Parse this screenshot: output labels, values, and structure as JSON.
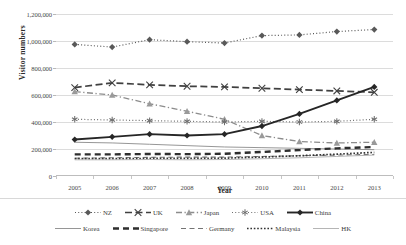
{
  "chart_data": {
    "type": "line",
    "title": "",
    "xlabel": "Year",
    "ylabel": "Visitor numbers",
    "categories": [
      "2005",
      "2006",
      "2007",
      "2008",
      "2009",
      "2010",
      "2011",
      "2012",
      "2013"
    ],
    "x": [
      2005,
      2006,
      2007,
      2008,
      2009,
      2010,
      2011,
      2012,
      2013
    ],
    "ylim": [
      0,
      1200000
    ],
    "ytick_labels": [
      "0",
      "200,000",
      "400,000",
      "600,000",
      "800,000",
      "1,000,000",
      "1,200,000"
    ],
    "ytick_values": [
      0,
      200000,
      400000,
      600000,
      800000,
      1000000,
      1200000
    ],
    "grid": true,
    "legend_position": "bottom",
    "series": [
      {
        "name": "NZ",
        "style": "dotted",
        "marker": "diamond",
        "color": "#595959",
        "values": [
          975000,
          955000,
          1010000,
          995000,
          985000,
          1040000,
          1045000,
          1070000,
          1085000
        ]
      },
      {
        "name": "UK",
        "style": "dashed",
        "marker": "x",
        "color": "#404040",
        "values": [
          655000,
          690000,
          675000,
          665000,
          660000,
          650000,
          640000,
          630000,
          620000
        ]
      },
      {
        "name": "Japan",
        "style": "dashdot",
        "marker": "triangle",
        "color": "#8c8c8c",
        "values": [
          625000,
          600000,
          535000,
          480000,
          420000,
          300000,
          255000,
          245000,
          250000
        ]
      },
      {
        "name": "USA",
        "style": "dotted",
        "marker": "asterisk",
        "color": "#6e6e6e",
        "values": [
          420000,
          415000,
          410000,
          405000,
          400000,
          405000,
          400000,
          405000,
          420000
        ]
      },
      {
        "name": "China",
        "style": "solid",
        "marker": "diamond",
        "color": "#262626",
        "values": [
          270000,
          290000,
          310000,
          300000,
          310000,
          370000,
          460000,
          560000,
          660000
        ]
      },
      {
        "name": "Korea",
        "style": "solid-thin",
        "marker": "none",
        "color": "#8a8a8a",
        "values": [
          250000,
          245000,
          235000,
          225000,
          215000,
          210000,
          205000,
          200000,
          195000
        ]
      },
      {
        "name": "Singapore",
        "style": "dashed-thick",
        "marker": "none",
        "color": "#2e2e2e",
        "values": [
          160000,
          160000,
          163000,
          162000,
          165000,
          178000,
          192000,
          205000,
          215000
        ]
      },
      {
        "name": "Germany",
        "style": "dashed-long",
        "marker": "none",
        "color": "#747474",
        "values": [
          132000,
          135000,
          138000,
          140000,
          140000,
          145000,
          150000,
          155000,
          160000
        ]
      },
      {
        "name": "Malaysia",
        "style": "dotted-thick",
        "marker": "none",
        "color": "#333333",
        "values": [
          128000,
          128000,
          130000,
          130000,
          132000,
          140000,
          150000,
          162000,
          175000
        ]
      },
      {
        "name": "HK",
        "style": "solid-light",
        "marker": "none",
        "color": "#adadad",
        "values": [
          120000,
          120000,
          122000,
          120000,
          122000,
          128000,
          135000,
          145000,
          155000
        ]
      }
    ]
  },
  "axes": {
    "ylabel": "Visitor numbers",
    "xlabel": "Year"
  },
  "legend": {
    "row1": [
      "NZ",
      "UK",
      "Japan",
      "USA",
      "China"
    ],
    "row2": [
      "Korea",
      "Singapore",
      "Germany",
      "Malaysia",
      "HK"
    ]
  }
}
